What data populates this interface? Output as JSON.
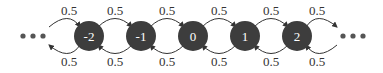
{
  "diagram": {
    "type": "markov-chain-random-walk",
    "nodes": [
      {
        "id": "n-2",
        "label": "-2",
        "cx": 89
      },
      {
        "id": "n-1",
        "label": "-1",
        "cx": 141
      },
      {
        "id": "n0",
        "label": "0",
        "cx": 193
      },
      {
        "id": "n1",
        "label": "1",
        "cx": 245
      },
      {
        "id": "n2",
        "label": "2",
        "cx": 297
      }
    ],
    "forward_probs": [
      "0.5",
      "0.5",
      "0.5",
      "0.5",
      "0.5",
      "0.5"
    ],
    "backward_probs": [
      "0.5",
      "0.5",
      "0.5",
      "0.5",
      "0.5",
      "0.5"
    ],
    "ellipsis_left": "•••",
    "ellipsis_right": "•••",
    "colors": {
      "node_fill": "#3d3d3d",
      "node_text": "#ffffff",
      "arrow": "#333333",
      "text": "#333333"
    }
  }
}
